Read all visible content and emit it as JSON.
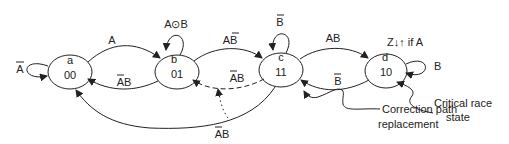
{
  "states": [
    {
      "id": "a",
      "name": "a",
      "code": "00"
    },
    {
      "id": "b",
      "name": "b",
      "code": "01"
    },
    {
      "id": "c",
      "name": "c",
      "code": "11"
    },
    {
      "id": "d",
      "name": "d",
      "code": "10"
    }
  ],
  "transitions": {
    "a_self": {
      "label_main": "A",
      "overbar": true
    },
    "a_to_b": {
      "label": "A"
    },
    "b_to_a": {
      "label_bar": "A",
      "label_rest": "B"
    },
    "b_self": {
      "label": "A⊙B"
    },
    "b_to_c": {
      "label_main": "A",
      "label_bar": "B"
    },
    "c_self": {
      "label_bar": "B"
    },
    "c_to_b_dashed": {
      "label_bar": "A",
      "label_rest": "B"
    },
    "c_to_a": {
      "label_bar": "A",
      "label_rest": "B"
    },
    "c_to_d": {
      "label": "AB"
    },
    "d_to_c": {
      "label_bar": "B"
    },
    "d_self": {
      "label": "B"
    }
  },
  "annotations": {
    "output_note": "Z↓↑   if A",
    "correction_line1": "Correction path",
    "correction_line2": "replacement",
    "critical_line1": "Critical race",
    "critical_line2": "state"
  },
  "colors": {
    "stroke": "#222222",
    "background": "#ffffff"
  }
}
